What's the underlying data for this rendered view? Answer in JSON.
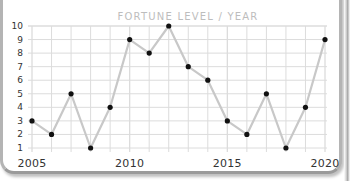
{
  "chart_data": {
    "type": "line",
    "title": "FORTUNE LEVEL / YEAR",
    "xlabel": "",
    "ylabel": "",
    "x": [
      2005,
      2006,
      2007,
      2008,
      2009,
      2010,
      2011,
      2012,
      2013,
      2014,
      2015,
      2016,
      2017,
      2018,
      2019,
      2020
    ],
    "series": [
      {
        "name": "Fortune level",
        "values": [
          3,
          2,
          5,
          1,
          4,
          9,
          8,
          10,
          7,
          6,
          3,
          2,
          5,
          1,
          4,
          9
        ]
      }
    ],
    "xticks": [
      "2005",
      "2010",
      "2015",
      "2020"
    ],
    "yticks": [
      "1",
      "2",
      "3",
      "4",
      "5",
      "6",
      "7",
      "8",
      "9",
      "10"
    ],
    "ylim": [
      1,
      10
    ],
    "xlim": [
      2005,
      2020
    ],
    "grid": true,
    "legend": null,
    "colors": {
      "line": "#c8c8c8",
      "marker": "#111111",
      "grid": "#dcdcdc",
      "title": "#bdbdbd",
      "text": "#333333"
    }
  }
}
